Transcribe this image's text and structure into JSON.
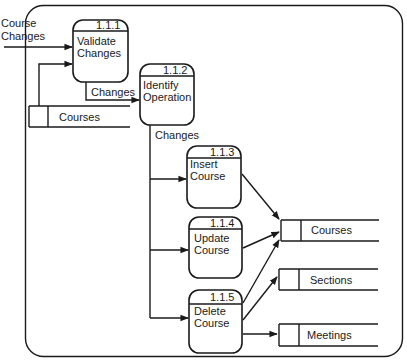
{
  "diagram": {
    "type": "data-flow-diagram",
    "colors": {
      "stroke": "#1a1a1a",
      "background": "#ffffff"
    },
    "processes": [
      {
        "id": "1.1.1",
        "label_line1": "Validate",
        "label_line2": "Changes"
      },
      {
        "id": "1.1.2",
        "label_line1": "Identify",
        "label_line2": "Operation"
      },
      {
        "id": "1.1.3",
        "label_line1": "Insert",
        "label_line2": "Course"
      },
      {
        "id": "1.1.4",
        "label_line1": "Update",
        "label_line2": "Course"
      },
      {
        "id": "1.1.5",
        "label_line1": "Delete",
        "label_line2": "Course"
      }
    ],
    "data_stores": [
      {
        "name": "Courses",
        "position": "left"
      },
      {
        "name": "Courses",
        "position": "right"
      },
      {
        "name": "Sections",
        "position": "right"
      },
      {
        "name": "Meetings",
        "position": "right"
      }
    ],
    "flows": [
      {
        "label_line1": "Course",
        "label_line2": "Changes",
        "from": "external",
        "to": "1.1.1"
      },
      {
        "label": "",
        "from": "Courses (left)",
        "to": "1.1.1"
      },
      {
        "label": "Changes",
        "from": "1.1.1",
        "to": "1.1.2"
      },
      {
        "label": "Changes",
        "from": "1.1.2",
        "to": "1.1.3 / 1.1.4 / 1.1.5"
      },
      {
        "label": "",
        "from": "1.1.3",
        "to": "Courses (right)"
      },
      {
        "label": "",
        "from": "1.1.4",
        "to": "Courses (right)"
      },
      {
        "label": "",
        "from": "1.1.5",
        "to": "Courses (right)"
      },
      {
        "label": "",
        "from": "1.1.5",
        "to": "Sections"
      },
      {
        "label": "",
        "from": "1.1.5",
        "to": "Meetings"
      }
    ]
  }
}
